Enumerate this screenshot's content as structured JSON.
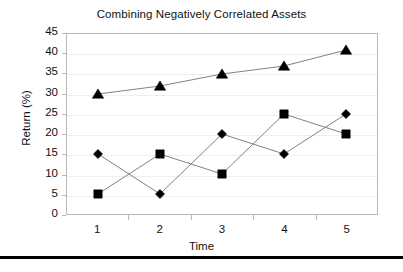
{
  "chart_data": {
    "type": "line",
    "title": "Combining Negatively Correlated Assets",
    "xlabel": "Time",
    "ylabel": "Return (%)",
    "categories": [
      "1",
      "2",
      "3",
      "4",
      "5"
    ],
    "x": [
      1,
      2,
      3,
      4,
      5
    ],
    "ylim": [
      0,
      45
    ],
    "ytick_step": 5,
    "yticks": [
      "45",
      "40",
      "35",
      "30",
      "25",
      "20",
      "15",
      "10",
      "5",
      "0"
    ],
    "grid": true,
    "grid_axis": "y",
    "legend": "none",
    "line_color": "#808080",
    "marker_color": "#000000",
    "series": [
      {
        "name": "portfolio",
        "marker": "triangle",
        "values": [
          30,
          32,
          35,
          37,
          41
        ]
      },
      {
        "name": "asset-b",
        "marker": "square",
        "values": [
          5,
          15,
          10,
          25,
          20
        ]
      },
      {
        "name": "asset-a",
        "marker": "diamond",
        "values": [
          15,
          5,
          20,
          15,
          25
        ]
      }
    ]
  }
}
